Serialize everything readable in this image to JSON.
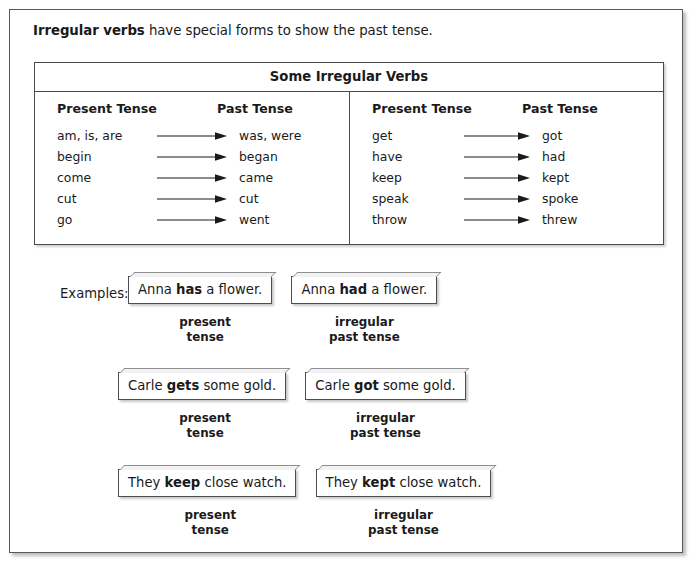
{
  "intro": {
    "lead": "Irregular verbs",
    "rest": " have special forms to show the past tense."
  },
  "table": {
    "title": "Some Irregular Verbs",
    "headers": {
      "present": "Present Tense",
      "past": "Past Tense"
    },
    "left_column": [
      {
        "present": "am, is, are",
        "past": "was, were"
      },
      {
        "present": "begin",
        "past": "began"
      },
      {
        "present": "come",
        "past": "came"
      },
      {
        "present": "cut",
        "past": "cut"
      },
      {
        "present": "go",
        "past": "went"
      }
    ],
    "right_column": [
      {
        "present": "get",
        "past": "got"
      },
      {
        "present": "have",
        "past": "had"
      },
      {
        "present": "keep",
        "past": "kept"
      },
      {
        "present": "speak",
        "past": "spoke"
      },
      {
        "present": "throw",
        "past": "threw"
      }
    ]
  },
  "examples": {
    "label": "Examples:",
    "rows": [
      {
        "present": {
          "before": "Anna ",
          "bold": "has",
          "after": " a flower."
        },
        "past": {
          "before": "Anna ",
          "bold": "had",
          "after": " a flower."
        },
        "present_caption_1": "present",
        "present_caption_2": "tense",
        "past_caption_1": "irregular",
        "past_caption_2": "past tense"
      },
      {
        "present": {
          "before": "Carle ",
          "bold": "gets",
          "after": " some gold."
        },
        "past": {
          "before": "Carle ",
          "bold": "got",
          "after": " some gold."
        },
        "present_caption_1": "present",
        "present_caption_2": "tense",
        "past_caption_1": "irregular",
        "past_caption_2": "past tense"
      },
      {
        "present": {
          "before": "They ",
          "bold": "keep",
          "after": " close watch."
        },
        "past": {
          "before": "They ",
          "bold": "kept",
          "after": " close watch."
        },
        "present_caption_1": "present",
        "present_caption_2": "tense",
        "past_caption_1": "irregular",
        "past_caption_2": "past tense"
      }
    ]
  },
  "icons": {
    "arrow": "right-arrow-icon"
  },
  "colors": {
    "page_background": "#ffffff",
    "text": "#1a1a1a",
    "rule": "#4a4a4c",
    "page_border": "#59595b"
  }
}
